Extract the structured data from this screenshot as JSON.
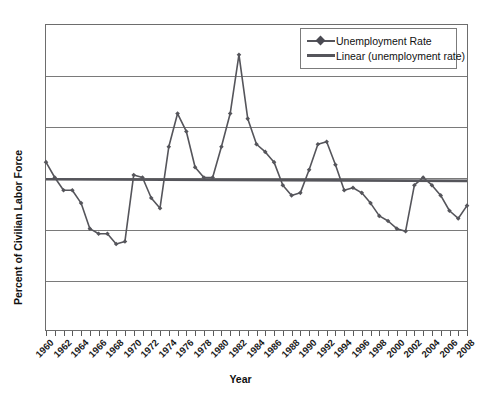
{
  "chart_data": {
    "type": "line",
    "title": "",
    "xlabel": "Year",
    "ylabel": "Percent of Civilian Labor Force",
    "ylim": [
      0,
      12
    ],
    "yticks": [
      0,
      2,
      4,
      6,
      8,
      10,
      12
    ],
    "xlim": [
      1960,
      2008
    ],
    "grid": "horizontal",
    "legend_position": "top-right",
    "legend": [
      "Unemployment Rate",
      "Linear (unemployment rate)"
    ],
    "x": [
      1960,
      1961,
      1962,
      1963,
      1964,
      1965,
      1966,
      1967,
      1968,
      1969,
      1970,
      1971,
      1972,
      1973,
      1974,
      1975,
      1976,
      1977,
      1978,
      1979,
      1980,
      1981,
      1982,
      1983,
      1984,
      1985,
      1986,
      1987,
      1988,
      1989,
      1990,
      1991,
      1992,
      1993,
      1994,
      1995,
      1996,
      1997,
      1998,
      1999,
      2000,
      2001,
      2002,
      2003,
      2004,
      2005,
      2006,
      2007,
      2008
    ],
    "xtick_labels": [
      "1960",
      "1962",
      "1964",
      "1966",
      "1968",
      "1970",
      "1972",
      "1974",
      "1976",
      "1978",
      "1980",
      "1982",
      "1984",
      "1986",
      "1988",
      "1990",
      "1992",
      "1994",
      "1996",
      "1998",
      "2000",
      "2002",
      "2004",
      "2006",
      "2008"
    ],
    "series": [
      {
        "name": "Unemployment Rate",
        "marker": "diamond",
        "color": "#55555b",
        "values": [
          6.6,
          6.0,
          5.5,
          5.5,
          5.0,
          4.0,
          3.8,
          3.8,
          3.4,
          3.5,
          6.1,
          6.0,
          5.2,
          4.8,
          7.2,
          8.5,
          7.8,
          6.4,
          6.0,
          6.0,
          7.2,
          8.5,
          10.8,
          8.3,
          7.3,
          7.0,
          6.6,
          5.7,
          5.3,
          5.4,
          6.3,
          7.3,
          7.4,
          6.5,
          5.5,
          5.6,
          5.4,
          5.0,
          4.5,
          4.3,
          4.0,
          3.9,
          5.7,
          6.0,
          5.7,
          5.3,
          4.7,
          4.4,
          4.9
        ]
      },
      {
        "name": "Linear (unemployment rate)",
        "type": "trendline",
        "color": "#55555b",
        "start_value": 5.93,
        "end_value": 5.87
      }
    ],
    "final_point": {
      "year": 2008,
      "value": 7.2
    }
  },
  "axes": {
    "ylabel": "Percent of Civilian Labor Force",
    "xlabel": "Year"
  },
  "legend": {
    "items": [
      {
        "label": "Unemployment Rate"
      },
      {
        "label": "Linear (unemployment rate)"
      }
    ]
  }
}
